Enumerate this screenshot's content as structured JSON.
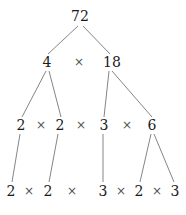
{
  "figure": {
    "kind": "factor-tree",
    "root_value": "72",
    "operator_symbol": "×",
    "text_color": "#1a1a1a",
    "operator_color": "#555555",
    "edge_color": "#858585",
    "background_color": "#ffffff"
  },
  "levels": [
    {
      "level": 0,
      "nodes": [
        {
          "label": "72",
          "x": 80,
          "y": 16
        }
      ],
      "operators": []
    },
    {
      "level": 1,
      "nodes": [
        {
          "label": "4",
          "x": 47,
          "y": 62
        },
        {
          "label": "18",
          "x": 112,
          "y": 62
        }
      ],
      "operators": [
        {
          "label": "×",
          "x": 79,
          "y": 62
        }
      ]
    },
    {
      "level": 2,
      "nodes": [
        {
          "label": "2",
          "x": 21,
          "y": 125
        },
        {
          "label": "2",
          "x": 60,
          "y": 125
        },
        {
          "label": "3",
          "x": 104,
          "y": 125
        },
        {
          "label": "6",
          "x": 152,
          "y": 125
        }
      ],
      "operators": [
        {
          "label": "×",
          "x": 41,
          "y": 125
        },
        {
          "label": "×",
          "x": 81,
          "y": 125
        },
        {
          "label": "×",
          "x": 127,
          "y": 125
        }
      ]
    },
    {
      "level": 3,
      "nodes": [
        {
          "label": "2",
          "x": 11,
          "y": 191
        },
        {
          "label": "2",
          "x": 48,
          "y": 191
        },
        {
          "label": "3",
          "x": 103,
          "y": 191
        },
        {
          "label": "2",
          "x": 139,
          "y": 191
        },
        {
          "label": "3",
          "x": 175,
          "y": 191
        }
      ],
      "operators": [
        {
          "label": "×",
          "x": 29,
          "y": 191
        },
        {
          "label": "×",
          "x": 72,
          "y": 191
        },
        {
          "label": "×",
          "x": 121,
          "y": 191
        },
        {
          "label": "×",
          "x": 157,
          "y": 191
        }
      ]
    }
  ],
  "edges": [
    {
      "from": "72",
      "to": "4",
      "x1": 78,
      "y1": 26,
      "x2": 48,
      "y2": 54
    },
    {
      "from": "72",
      "to": "18",
      "x1": 83,
      "y1": 26,
      "x2": 110,
      "y2": 54
    },
    {
      "from": "4",
      "to": "2",
      "x1": 46,
      "y1": 71,
      "x2": 22,
      "y2": 117
    },
    {
      "from": "4",
      "to": "2",
      "x1": 49,
      "y1": 71,
      "x2": 61,
      "y2": 117
    },
    {
      "from": "18",
      "to": "3",
      "x1": 109,
      "y1": 71,
      "x2": 104,
      "y2": 117
    },
    {
      "from": "18",
      "to": "6",
      "x1": 112,
      "y1": 71,
      "x2": 152,
      "y2": 117
    },
    {
      "from": "2",
      "to": "2",
      "x1": 20,
      "y1": 134,
      "x2": 12,
      "y2": 182
    },
    {
      "from": "2",
      "to": "2",
      "x1": 58,
      "y1": 134,
      "x2": 49,
      "y2": 182
    },
    {
      "from": "3",
      "to": "3",
      "x1": 103,
      "y1": 134,
      "x2": 103,
      "y2": 182
    },
    {
      "from": "6",
      "to": "2",
      "x1": 151,
      "y1": 134,
      "x2": 140,
      "y2": 182
    },
    {
      "from": "6",
      "to": "3",
      "x1": 154,
      "y1": 134,
      "x2": 174,
      "y2": 182
    }
  ]
}
